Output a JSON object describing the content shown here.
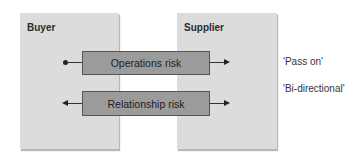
{
  "diagram": {
    "parties": [
      {
        "id": "buyer",
        "label": "Buyer"
      },
      {
        "id": "supplier",
        "label": "Supplier"
      }
    ],
    "risks": [
      {
        "id": "ops",
        "label": "Operations risk",
        "direction": "buyer-to-supplier",
        "annotation": "'Pass on'"
      },
      {
        "id": "rel",
        "label": "Relationship risk",
        "direction": "bi-directional",
        "annotation": "'Bi-directional'"
      }
    ],
    "colors": {
      "party_fill": "#dcdcdc",
      "risk_fill": "#9b9b9b",
      "line": "#333333"
    }
  }
}
